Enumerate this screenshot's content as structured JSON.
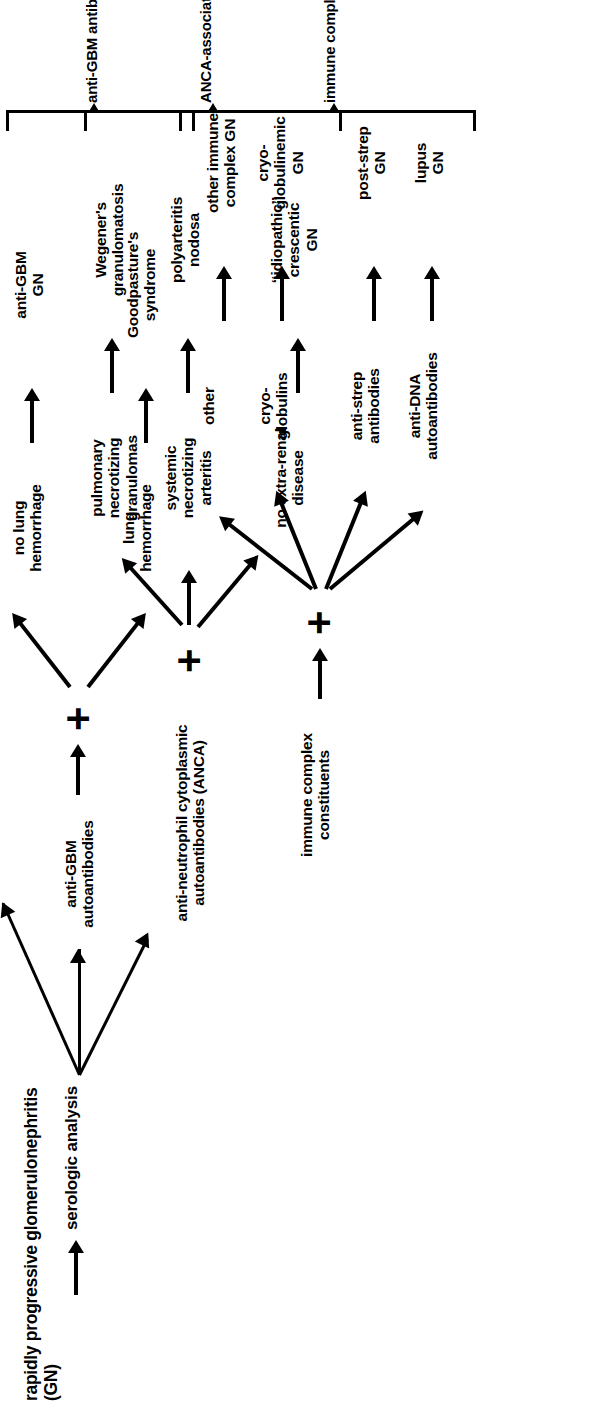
{
  "figure": {
    "title": "rapidly progressive glomerulonephritis (GN)",
    "root_step": "serologic analysis",
    "plus_symbol": "+"
  },
  "branches": [
    {
      "id": "anca",
      "marker": "anti-neutrophil cytoplasmic\nautoantibodies (ANCA)",
      "category": "ANCA-associated GN",
      "findings": [
        {
          "feature": "pulmonary\nnecrotizing\ngranulomas",
          "diagnosis": "Wegener's\ngranulomatosis"
        },
        {
          "feature": "systemic\nnecrotizing\narteritis",
          "diagnosis": "polyarteritis\nnodosa"
        },
        {
          "feature": "no extra-renal\ndisease",
          "diagnosis": "‘‘idiopathic’’\ncrescentic\nGN"
        }
      ]
    },
    {
      "id": "antigbm",
      "marker": "anti-GBM\nautoantibodies",
      "category": "anti-GBM antibody-mediated GN",
      "findings": [
        {
          "feature": "no lung\nhemorrhage",
          "diagnosis": "anti-GBM\nGN"
        },
        {
          "feature": "lung\nhemorrhage",
          "diagnosis": "Goodpasture's\nsyndrome"
        }
      ]
    },
    {
      "id": "immune",
      "marker": "immune complex\nconstituents",
      "category": "immune complex-mediated GN",
      "findings": [
        {
          "feature": "other",
          "diagnosis": "other immune\ncomplex GN"
        },
        {
          "feature": "cryo-\nglobulins",
          "diagnosis": "cryo-\nglobulinemic\nGN"
        },
        {
          "feature": "anti-strep\nantibodies",
          "diagnosis": "post-strep\nGN"
        },
        {
          "feature": "anti-DNA\nautoantibodies",
          "diagnosis": "lupus\nGN"
        }
      ]
    }
  ],
  "colors": {
    "ink": "#000000",
    "paper": "#ffffff"
  }
}
